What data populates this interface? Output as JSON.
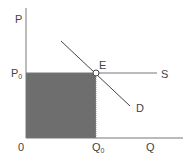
{
  "diagram": {
    "type": "supply-demand",
    "axes": {
      "y_label": "P",
      "x_label": "Q",
      "origin_label": "0"
    },
    "equilibrium": {
      "point_label": "E",
      "price_label": {
        "main": "P",
        "sub": "0"
      },
      "quantity_label": {
        "main": "Q",
        "sub": "0"
      }
    },
    "curves": {
      "supply_label": "S",
      "demand_label": "D"
    },
    "colors": {
      "axis": "#777777",
      "shaded_area": "#6e6e6e",
      "curve": "#444444",
      "text": "#444444"
    }
  }
}
